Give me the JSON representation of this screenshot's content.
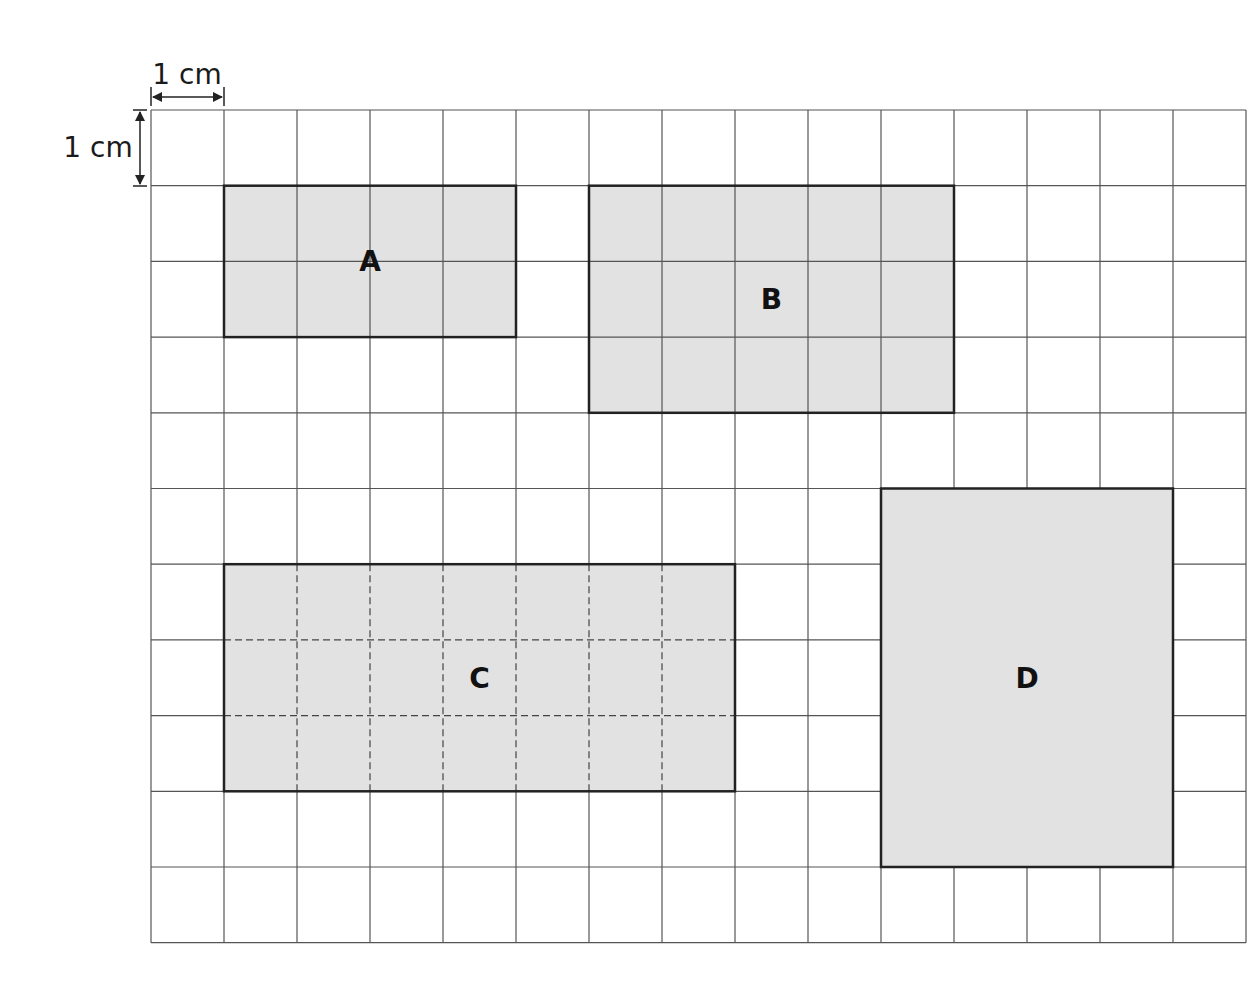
{
  "diagram": {
    "type": "grid-rectangles",
    "grid": {
      "columns": 15,
      "rows": 11,
      "origin_px": [
        151,
        110
      ],
      "cell_w_px": 73,
      "cell_h_px": 75.7,
      "line_color": "#555555",
      "background": "#ffffff"
    },
    "scale": {
      "horizontal_label": "1 cm",
      "vertical_label": "1 cm"
    },
    "shape_fill": "#e2e2e2",
    "shape_stroke": "#222222",
    "shapes": [
      {
        "label": "A",
        "col": 1,
        "row": 1,
        "width_cells": 4,
        "height_cells": 2,
        "interior_lines": "solid"
      },
      {
        "label": "B",
        "col": 6,
        "row": 1,
        "width_cells": 5,
        "height_cells": 3,
        "interior_lines": "solid"
      },
      {
        "label": "C",
        "col": 1,
        "row": 6,
        "width_cells": 7,
        "height_cells": 3,
        "interior_lines": "dashed"
      },
      {
        "label": "D",
        "col": 10,
        "row": 5,
        "width_cells": 4,
        "height_cells": 5,
        "interior_lines": "none"
      }
    ]
  }
}
